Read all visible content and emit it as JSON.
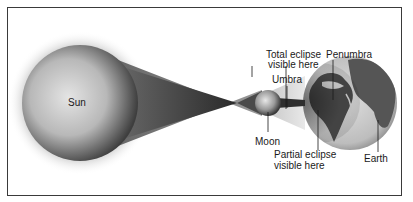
{
  "diagram": {
    "type": "solar-eclipse",
    "labels": {
      "sun": "Sun",
      "moon": "Moon",
      "earth": "Earth",
      "umbra": "Umbra",
      "penumbra": "Penumbra",
      "total_line1": "Total eclipse",
      "total_line2": "visible here",
      "partial_line1": "Partial eclipse",
      "partial_line2": "visible here"
    },
    "colors": {
      "frame": "#3a3a3a",
      "background": "#ffffff",
      "text": "#1a1a1a",
      "sun_light": "#d9d9d9",
      "sun_dark": "#4a4a4a",
      "cone": "#6a6a6a",
      "earth_ocean": "#cfcfcf",
      "earth_land": "#555555"
    }
  }
}
